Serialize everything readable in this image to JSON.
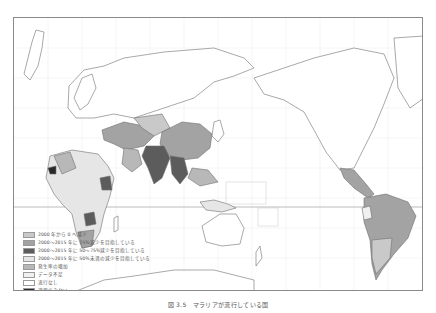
{
  "map": {
    "title": "マラリア流行国の発生率減少の進捗状況",
    "projection": "Pacific-centred world map",
    "colors": {
      "frame": "#8a8a8a",
      "coast": "#777777",
      "grid": "#d8d8d8",
      "equator": "#aaaaaa"
    }
  },
  "legend": {
    "items": [
      {
        "label": "2000 年から 0 へ減少",
        "color": "#c9c9c9"
      },
      {
        "label": "2000～2015 年に 75%減少を目指している",
        "color": "#a3a3a3"
      },
      {
        "label": "2000～2015 年に 50～75%減少を目指している",
        "color": "#5c5c5c"
      },
      {
        "label": "2000～2015 年に 50%未満の減少を目指している",
        "color": "#e6e6e6"
      },
      {
        "label": "発生率の増加",
        "color": "#b8b8b8"
      },
      {
        "label": "データ不足",
        "color": "#f0f0f0"
      },
      {
        "label": "流行なし",
        "color": "#ffffff"
      },
      {
        "label": "適用できない",
        "color": "#2a2a2a"
      }
    ]
  },
  "caption": "図 3.5　マラリアが流行している国"
}
